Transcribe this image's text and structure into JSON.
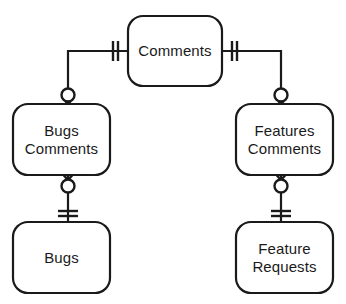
{
  "diagram": {
    "type": "entity-relationship",
    "notation": "crow's foot",
    "background_color": "#ffffff",
    "stroke_color": "#1a1a1a",
    "fill_color": "#ffffff",
    "entities": [
      {
        "id": "comments",
        "label": "Comments",
        "lines": [
          "Comments"
        ],
        "x": 128,
        "y": 16,
        "width": 94,
        "height": 70
      },
      {
        "id": "bugs-comments",
        "label": "Bugs Comments",
        "lines": [
          "Bugs",
          "Comments"
        ],
        "x": 13,
        "y": 104,
        "width": 97,
        "height": 71
      },
      {
        "id": "features-comments",
        "label": "Features Comments",
        "lines": [
          "Features",
          "Comments"
        ],
        "x": 236,
        "y": 104,
        "width": 97,
        "height": 71
      },
      {
        "id": "bugs",
        "label": "Bugs",
        "lines": [
          "Bugs"
        ],
        "x": 13,
        "y": 222,
        "width": 97,
        "height": 71
      },
      {
        "id": "feature-requests",
        "label": "Feature Requests",
        "lines": [
          "Feature",
          "Requests"
        ],
        "x": 236,
        "y": 222,
        "width": 97,
        "height": 71
      }
    ],
    "relationships": [
      {
        "id": "comments-to-bugs-comments",
        "from": "comments",
        "to": "bugs-comments",
        "from_cardinality": "exactly-one",
        "to_cardinality": "zero-or-many"
      },
      {
        "id": "comments-to-features-comments",
        "from": "comments",
        "to": "features-comments",
        "from_cardinality": "exactly-one",
        "to_cardinality": "zero-or-many"
      },
      {
        "id": "bugs-comments-to-bugs",
        "from": "bugs-comments",
        "to": "bugs",
        "from_cardinality": "zero-or-many",
        "to_cardinality": "exactly-one"
      },
      {
        "id": "features-comments-to-feature-requests",
        "from": "features-comments",
        "to": "feature-requests",
        "from_cardinality": "zero-or-many",
        "to_cardinality": "exactly-one"
      }
    ]
  }
}
